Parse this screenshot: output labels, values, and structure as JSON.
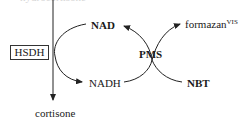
{
  "diagram": {
    "top_text_cutoff": "hydrocortisone",
    "enzyme": "HSDH",
    "product": "cortisone",
    "cofactor_oxidized": "NAD",
    "cofactor_reduced": "NADH",
    "mediator": "PMS",
    "dye_product": "formazan",
    "dye_product_superscript": "VIS",
    "dye_substrate": "NBT"
  }
}
